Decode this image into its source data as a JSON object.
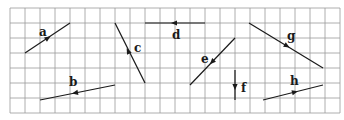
{
  "diagram": {
    "type": "vectors-on-grid",
    "grid": {
      "x0": 10,
      "y0": 8,
      "cell": 15,
      "cols": 22,
      "rows": 7,
      "line_color": "#9a9a9a"
    },
    "vectors": [
      {
        "label": "a",
        "from": [
          25,
          53
        ],
        "to": [
          70,
          23
        ],
        "arrow_at": [
          48,
          38
        ],
        "label_pos": [
          39,
          36
        ]
      },
      {
        "label": "b",
        "from": [
          115,
          85
        ],
        "to": [
          40,
          100
        ],
        "arrow_at": [
          75,
          93
        ],
        "label_pos": [
          69,
          86
        ]
      },
      {
        "label": "c",
        "from": [
          145,
          83
        ],
        "to": [
          115,
          23
        ],
        "arrow_at": [
          128,
          51
        ],
        "label_pos": [
          134,
          52
        ]
      },
      {
        "label": "d",
        "from": [
          205,
          23
        ],
        "to": [
          145,
          23
        ],
        "arrow_at": [
          174,
          23
        ],
        "label_pos": [
          172,
          39
        ]
      },
      {
        "label": "e",
        "from": [
          235,
          38
        ],
        "to": [
          190,
          85
        ],
        "arrow_at": [
          212,
          62
        ],
        "label_pos": [
          201,
          63
        ]
      },
      {
        "label": "f",
        "from": [
          235,
          70
        ],
        "to": [
          235,
          100
        ],
        "arrow_at": [
          235,
          87
        ],
        "label_pos": [
          241,
          92
        ]
      },
      {
        "label": "g",
        "from": [
          249,
          23
        ],
        "to": [
          323,
          68
        ],
        "arrow_at": [
          287,
          46
        ],
        "label_pos": [
          287,
          40
        ]
      },
      {
        "label": "h",
        "from": [
          263,
          100
        ],
        "to": [
          323,
          85
        ],
        "arrow_at": [
          295,
          92
        ],
        "label_pos": [
          290,
          85
        ]
      }
    ]
  }
}
